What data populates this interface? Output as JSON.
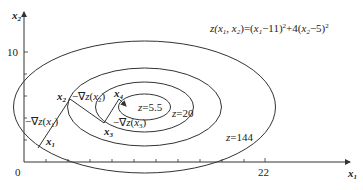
{
  "axes": {
    "x_label": "x1",
    "y_label": "x2",
    "origin_label": "0",
    "x_tick_label": "22",
    "y_tick_label": "10"
  },
  "contours": [
    {
      "label": "z=5.5",
      "value": 5.5
    },
    {
      "label": "z=20",
      "value": 20
    },
    {
      "label": "",
      "value": 50
    },
    {
      "label": "z=144",
      "value": 144
    }
  ],
  "points": [
    {
      "name": "x1",
      "gradient_label": "-∇z(x1)"
    },
    {
      "name": "x2",
      "gradient_label": "-∇z(x2)"
    },
    {
      "name": "x3",
      "gradient_label": "-∇z(x3)"
    },
    {
      "name": "x4",
      "gradient_label": ""
    }
  ],
  "colors": {
    "line": "#333333",
    "background": "#ffffff"
  }
}
